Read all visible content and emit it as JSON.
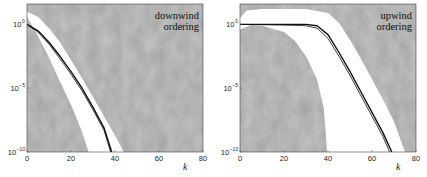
{
  "chart_data": [
    {
      "type": "line",
      "panel": "left",
      "annotation": [
        "downwind",
        "ordering"
      ],
      "xlabel": "k",
      "ylabel": "",
      "xlim": [
        0,
        80
      ],
      "ylim_log10": [
        -10,
        1.6
      ],
      "yscale": "log",
      "xticks": [
        0,
        20,
        40,
        60,
        80
      ],
      "yticks": [
        {
          "base": "10",
          "exp": "0",
          "value": 0
        },
        {
          "base": "10",
          "exp": "-5",
          "value": -5
        },
        {
          "base": "10",
          "exp": "-10",
          "value": -10
        }
      ],
      "background": "gray textured (region of parameter space)",
      "white_band": {
        "upper": [
          [
            0,
            1.0
          ],
          [
            5,
            0.6
          ],
          [
            10,
            -0.3
          ],
          [
            15,
            -1.4
          ],
          [
            20,
            -2.8
          ],
          [
            25,
            -4.2
          ],
          [
            30,
            -5.7
          ],
          [
            35,
            -7.2
          ],
          [
            40,
            -8.7
          ],
          [
            44,
            -10
          ]
        ],
        "lower": [
          [
            0,
            0.6
          ],
          [
            5,
            -0.9
          ],
          [
            10,
            -2.6
          ],
          [
            15,
            -4.5
          ],
          [
            20,
            -6.3
          ],
          [
            25,
            -8.4
          ],
          [
            28,
            -10
          ]
        ]
      },
      "series": [
        {
          "name": "curve-1",
          "style": "thick black",
          "points": [
            [
              0,
              0
            ],
            [
              5,
              -0.5
            ],
            [
              10,
              -1.4
            ],
            [
              15,
              -2.5
            ],
            [
              20,
              -3.7
            ],
            [
              25,
              -5.0
            ],
            [
              30,
              -6.5
            ],
            [
              35,
              -8.1
            ],
            [
              38.5,
              -10
            ]
          ]
        },
        {
          "name": "curve-2",
          "style": "thin black",
          "points": [
            [
              0,
              0
            ],
            [
              5,
              -0.6
            ],
            [
              10,
              -1.55
            ],
            [
              15,
              -2.7
            ],
            [
              20,
              -3.9
            ],
            [
              25,
              -5.2
            ],
            [
              30,
              -6.7
            ],
            [
              35,
              -8.3
            ],
            [
              38,
              -10
            ]
          ]
        }
      ]
    },
    {
      "type": "line",
      "panel": "right",
      "annotation": [
        "upwind",
        "ordering"
      ],
      "xlabel": "k",
      "ylabel": "",
      "xlim": [
        0,
        80
      ],
      "ylim_log10": [
        -10,
        1.6
      ],
      "yscale": "log",
      "xticks": [
        0,
        20,
        40,
        60,
        80
      ],
      "yticks": [
        {
          "base": "10",
          "exp": "0",
          "value": 0
        },
        {
          "base": "10",
          "exp": "-5",
          "value": -5
        },
        {
          "base": "10",
          "exp": "-10",
          "value": -10
        }
      ],
      "background": "gray textured (region of parameter space)",
      "white_band": {
        "upper": [
          [
            0,
            0.5
          ],
          [
            3,
            1.1
          ],
          [
            10,
            1.2
          ],
          [
            30,
            1.2
          ],
          [
            40,
            0.9
          ],
          [
            45,
            0.1
          ],
          [
            50,
            -1.2
          ],
          [
            55,
            -2.7
          ],
          [
            60,
            -4.3
          ],
          [
            65,
            -5.9
          ],
          [
            70,
            -7.6
          ],
          [
            75,
            -10
          ]
        ],
        "lower": [
          [
            0,
            -0.4
          ],
          [
            5,
            -0.05
          ],
          [
            10,
            -0.1
          ],
          [
            20,
            -0.6
          ],
          [
            25,
            -1.3
          ],
          [
            30,
            -2.5
          ],
          [
            35,
            -4.3
          ],
          [
            38,
            -6.5
          ],
          [
            39,
            -8.5
          ],
          [
            39.5,
            -10
          ]
        ]
      },
      "series": [
        {
          "name": "curve-1",
          "style": "thick black",
          "points": [
            [
              0,
              0
            ],
            [
              10,
              0
            ],
            [
              20,
              0
            ],
            [
              30,
              0
            ],
            [
              35,
              -0.1
            ],
            [
              40,
              -0.8
            ],
            [
              45,
              -2.2
            ],
            [
              50,
              -3.7
            ],
            [
              55,
              -5.3
            ],
            [
              60,
              -6.9
            ],
            [
              65,
              -8.5
            ],
            [
              69,
              -10
            ]
          ]
        },
        {
          "name": "curve-2",
          "style": "thin black",
          "points": [
            [
              0,
              0
            ],
            [
              10,
              -0.02
            ],
            [
              20,
              -0.05
            ],
            [
              30,
              -0.1
            ],
            [
              35,
              -0.3
            ],
            [
              40,
              -1.1
            ],
            [
              45,
              -2.5
            ],
            [
              50,
              -4.0
            ],
            [
              55,
              -5.6
            ],
            [
              60,
              -7.2
            ],
            [
              65,
              -8.8
            ],
            [
              68,
              -10
            ]
          ]
        }
      ]
    }
  ],
  "panels": {
    "left": {
      "annotation_line1": "downwind",
      "annotation_line2": "ordering",
      "xlabel": "k"
    },
    "right": {
      "annotation_line1": "upwind",
      "annotation_line2": "ordering",
      "xlabel": "k"
    }
  },
  "colors": {
    "background_gray": "#9a9a9a",
    "band": "#ffffff",
    "curve": "#111111"
  }
}
